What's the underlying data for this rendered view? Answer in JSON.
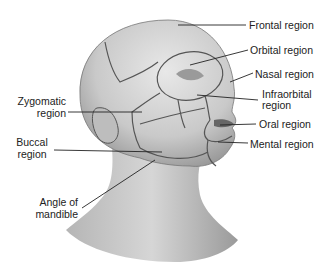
{
  "figure": {
    "labels": {
      "frontal": "Frontal region",
      "orbital": "Orbital region",
      "nasal": "Nasal region",
      "infraorbital_1": "Infraorbital",
      "infraorbital_2": "region",
      "oral": "Oral region",
      "mental": "Mental region",
      "zygomatic_1": "Zygomatic",
      "zygomatic_2": "region",
      "buccal_1": "Buccal",
      "buccal_2": "region",
      "angle_1": "Angle of",
      "angle_2": "mandible"
    }
  }
}
